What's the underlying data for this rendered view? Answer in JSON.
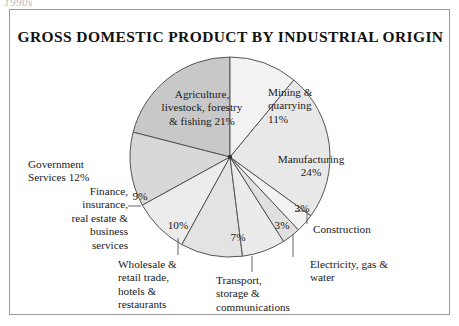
{
  "page": {
    "cutoff_text": "1990s"
  },
  "frame": {
    "title": "GROSS DOMESTIC PRODUCT BY INDUSTRIAL ORIGIN"
  },
  "chart_data": {
    "type": "pie",
    "title": "GROSS DOMESTIC PRODUCT BY INDUSTRIAL ORIGIN",
    "xlabel": "",
    "ylabel": "",
    "legend": "none",
    "grid": false,
    "total": 100,
    "units": "percent",
    "categories": [
      "Mining & quarrying",
      "Manufacturing",
      "Construction",
      "Electricity, gas & water",
      "Transport, storage & communications",
      "Wholesale & retail trade, hotels & restaurants",
      "Finance, insurance, real estate & business services",
      "Government Services",
      "Agriculture, livestock, forestry & fishing"
    ],
    "values": [
      11,
      24,
      3,
      3,
      7,
      10,
      9,
      12,
      21
    ],
    "slices": [
      {
        "name": "Mining & quarrying",
        "label": "Mining &\nquarrying\n11%",
        "value": 11,
        "pct_text": "11%",
        "label_placement": "inside",
        "fill": "#f2f2f2"
      },
      {
        "name": "Manufacturing",
        "label": "Manufacturing\n24%",
        "value": 24,
        "pct_text": "24%",
        "label_placement": "inside",
        "fill": "#e8e8e8"
      },
      {
        "name": "Construction",
        "label": "Construction",
        "value": 3,
        "pct_text": "3%",
        "label_placement": "outside-leader",
        "fill": "#f2f2f2"
      },
      {
        "name": "Electricity, gas & water",
        "label": "Electricity, gas &\nwater",
        "value": 3,
        "pct_text": "3%",
        "label_placement": "outside-leader",
        "fill": "#e0e0e0"
      },
      {
        "name": "Transport, storage & communications",
        "label": "Transport,\nstorage &\ncommunications",
        "value": 7,
        "pct_text": "7%",
        "label_placement": "outside-leader",
        "fill": "#ebebeb"
      },
      {
        "name": "Wholesale & retail trade, hotels & restaurants",
        "label": "Wholesale &\nretail trade,\nhotels &\nrestaurants",
        "value": 10,
        "pct_text": "10%",
        "label_placement": "outside-leader",
        "fill": "#e3e3e3"
      },
      {
        "name": "Finance, insurance, real estate & business services",
        "label": "Finance,\ninsurance,\nreal estate &\nbusiness\nservices",
        "value": 9,
        "pct_text": "9%",
        "label_placement": "outside-leader",
        "fill": "#ececec"
      },
      {
        "name": "Government Services",
        "label": "Government\nServices 12%",
        "value": 12,
        "pct_text": "12%",
        "label_placement": "inside",
        "fill": "#d8d8d8"
      },
      {
        "name": "Agriculture, livestock, forestry & fishing",
        "label": "Agriculture,\nlivestock, forestry\n& fishing 21%",
        "value": 21,
        "pct_text": "21%",
        "label_placement": "inside",
        "fill": "#c8c8c8"
      }
    ]
  },
  "colors": {
    "frame_border": "#9a9a9a",
    "slice_outline": "#555555",
    "text": "#1a1a1a",
    "background": "#ffffff"
  }
}
